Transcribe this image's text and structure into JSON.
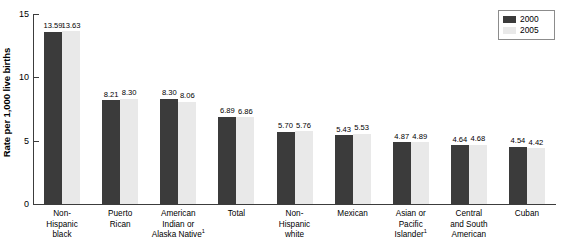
{
  "chart_data": {
    "type": "bar",
    "title": "",
    "xlabel": "",
    "ylabel": "Rate per 1,000 live births",
    "ylim": [
      0,
      15
    ],
    "yticks": [
      0,
      5,
      10,
      15
    ],
    "ytick_labels": [
      "0",
      "5",
      "10",
      "15"
    ],
    "grid": false,
    "legend_position": "top-right",
    "categories": [
      "Non-\nHispanic\nblack",
      "Puerto\nRican",
      "American\nIndian or\nAlaska Native",
      "Total",
      "Non-\nHispanic\nwhite",
      "Mexican",
      "Asian or\nPacific\nIslander",
      "Central\nand South\nAmerican",
      "Cuban"
    ],
    "category_footnotes": [
      "",
      "",
      "1",
      "",
      "",
      "",
      "1",
      "",
      ""
    ],
    "series": [
      {
        "name": "2000",
        "color": "#3b3b3b",
        "values": [
          13.59,
          8.21,
          8.3,
          6.89,
          5.7,
          5.43,
          4.87,
          4.64,
          4.54
        ]
      },
      {
        "name": "2005",
        "color": "#e9e9e9",
        "values": [
          13.63,
          8.3,
          8.06,
          6.86,
          5.76,
          5.53,
          4.89,
          4.68,
          4.42
        ]
      }
    ],
    "value_labels": [
      [
        "13.59",
        "13.63"
      ],
      [
        "8.21",
        "8.30"
      ],
      [
        "8.30",
        "8.06"
      ],
      [
        "6.89",
        "6.86"
      ],
      [
        "5.70",
        "5.76"
      ],
      [
        "5.43",
        "5.53"
      ],
      [
        "4.87",
        "4.89"
      ],
      [
        "4.64",
        "4.68"
      ],
      [
        "4.54",
        "4.42"
      ]
    ]
  },
  "legend": {
    "items": [
      {
        "label": "2000",
        "color": "#3b3b3b"
      },
      {
        "label": "2005",
        "color": "#e9e9e9"
      }
    ]
  }
}
